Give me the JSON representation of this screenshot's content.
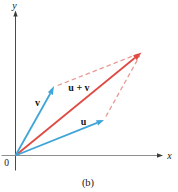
{
  "figure": {
    "caption": "(b)"
  },
  "labels": {
    "y_axis": "y",
    "x_axis": "x",
    "origin": "0",
    "vector_v": "v",
    "vector_u": "u",
    "vector_sum": "u + v"
  },
  "colors": {
    "background": "#ffffff",
    "axis_x": "#8d8d8d",
    "axis_y": "#4a4a4a",
    "axis_arrow": "#3c3c3c",
    "vector_blue": "#3fa5d8",
    "vector_red": "#df4b42",
    "dashed_pink": "#e89a93",
    "label_text": "#161616"
  }
}
